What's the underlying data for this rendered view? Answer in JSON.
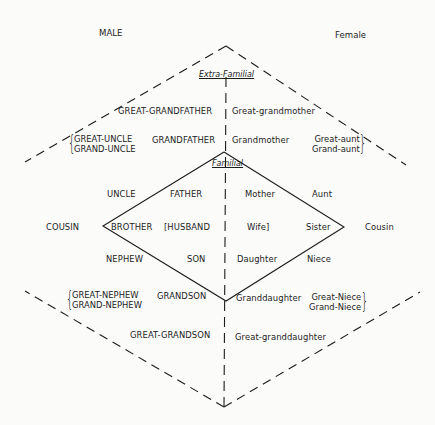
{
  "headers": {
    "male": "MALE",
    "female": "Female"
  },
  "sections": {
    "extra_familial": "Extra-Familial",
    "familial": "Familial"
  },
  "male_terms": {
    "great_grandfather": "GREAT-GRANDFATHER",
    "grandfather": "GRANDFATHER",
    "great_uncle": "GREAT-UNCLE",
    "grand_uncle": "GRAND-UNCLE",
    "uncle": "UNCLE",
    "father": "FATHER",
    "cousin": "COUSIN",
    "brother": "BROTHER",
    "husband": "[HUSBAND",
    "nephew": "NEPHEW",
    "son": "SON",
    "great_nephew": "GREAT-NEPHEW",
    "grand_nephew": "GRAND-NEPHEW",
    "grandson": "GRANDSON",
    "great_grandson": "GREAT-GRANDSON"
  },
  "female_terms": {
    "great_grandmother": "Great-grandmother",
    "grandmother": "Grandmother",
    "great_aunt": "Great-aunt",
    "grand_aunt": "Grand-aunt",
    "mother": "Mother",
    "aunt": "Aunt",
    "wife": "Wife]",
    "sister": "Sister",
    "cousin": "Cousin",
    "daughter": "Daughter",
    "niece": "Niece",
    "granddaughter": "Granddaughter",
    "great_niece": "Great-Niece",
    "grand_niece": "Grand-Niece",
    "great_granddaughter": "Great-granddaughter"
  },
  "braces": {
    "open": "{",
    "close": "}"
  },
  "colors": {
    "ink": "#1c1c1c",
    "paper": "#fbfbfa"
  }
}
